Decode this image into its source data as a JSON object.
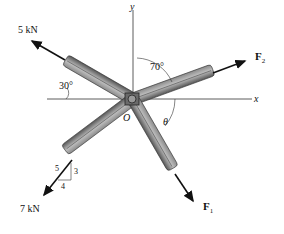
{
  "diagram": {
    "axes": {
      "x_label": "x",
      "y_label": "y",
      "origin_label": "O"
    },
    "forces": [
      {
        "id": "5kN",
        "label": "5 kN",
        "angle_label": "30°",
        "angle_reference": "from negative x-axis, above"
      },
      {
        "id": "F2",
        "label": "F",
        "subscript": "2",
        "angle_label": "70°",
        "angle_reference": "from positive y-axis"
      },
      {
        "id": "F1",
        "label": "F",
        "subscript": "1",
        "angle_label": "θ",
        "angle_reference": "from positive x-axis, below"
      },
      {
        "id": "7kN",
        "label": "7 kN",
        "slope_triangle": {
          "hyp": "5",
          "vertical": "3",
          "horizontal": "4"
        }
      }
    ],
    "colors": {
      "member_dark": "#4a4a4a",
      "member_light": "#a8a8a8",
      "arrow": "#111111",
      "axis": "#333333"
    }
  }
}
